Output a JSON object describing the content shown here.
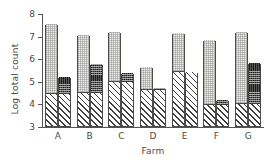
{
  "chart_data": {
    "type": "bar",
    "title": "",
    "xlabel": "Farm",
    "ylabel": "Log total count",
    "categories": [
      "A",
      "B",
      "C",
      "D",
      "E",
      "F",
      "G"
    ],
    "ylim": [
      3,
      8
    ],
    "yticks": [
      3,
      4,
      5,
      6,
      7,
      8
    ],
    "grid": false,
    "legend": "none",
    "stacked": true,
    "note": "Each farm has two adjacent stacked bars: a left bar (hatched base + light stippled top) and a right bar (hatched base + dark checkered top). Bars start at the y-axis baseline of 3.",
    "series": [
      {
        "name": "left-bar-base",
        "fill": "diagonal-hatch",
        "values": [
          4.42,
          4.48,
          4.95,
          4.6,
          5.38,
          3.95,
          3.97
        ]
      },
      {
        "name": "left-bar-total",
        "fill": "light-stipple",
        "values": [
          7.5,
          7.04,
          7.16,
          5.6,
          7.12,
          6.79,
          7.14
        ]
      },
      {
        "name": "right-bar-base",
        "fill": "diagonal-hatch",
        "values": [
          4.42,
          4.45,
          4.95,
          4.6,
          5.38,
          3.95,
          3.97
        ]
      },
      {
        "name": "right-bar-total",
        "fill": "dark-checker",
        "values": [
          5.16,
          5.73,
          5.36,
          4.7,
          5.38,
          4.14,
          5.79
        ]
      }
    ],
    "colors": {
      "axis": "#555555",
      "outline": "#4b4b4b",
      "light_fill": "#eeeeea",
      "dark_fill": "#555555",
      "text": "#4a4a4a"
    }
  }
}
